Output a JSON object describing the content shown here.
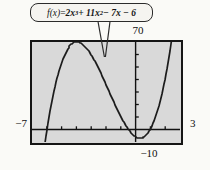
{
  "figure": {
    "formula_label": {
      "fx": "f(x)",
      "equals": " = ",
      "t1": "2x",
      "e1": "3",
      "t2": " + 11x",
      "e2": "2",
      "t3": " − 7x − 6"
    },
    "axis_labels": {
      "ymax": "70",
      "ymin": "−10",
      "xmin": "−7",
      "xmax": "3"
    }
  },
  "chart_data": {
    "type": "line",
    "xlabel": "",
    "ylabel": "",
    "function": {
      "coefficients_desc": [
        2,
        11,
        -7,
        -6
      ]
    },
    "xlim": [
      -7,
      3
    ],
    "ylim": [
      -10,
      70
    ],
    "x_tick_step": 1,
    "y_tick_step": 10,
    "x_intercepts": [
      -6,
      -0.5,
      1
    ],
    "local_max": {
      "x": -4.0,
      "y": 70
    },
    "local_min": {
      "x": 0.3,
      "y": -7.1
    },
    "grid": false,
    "legend": "none",
    "colors": {
      "curve": "#1c1c1c",
      "axis": "#121212",
      "tick": "#121212",
      "plot_bg": "#d9d9d9",
      "frame": "#151515",
      "callout_bg": "#f5f4f0",
      "callout_border": "#2b2b2b",
      "page_bg": "#fafaf7"
    }
  }
}
